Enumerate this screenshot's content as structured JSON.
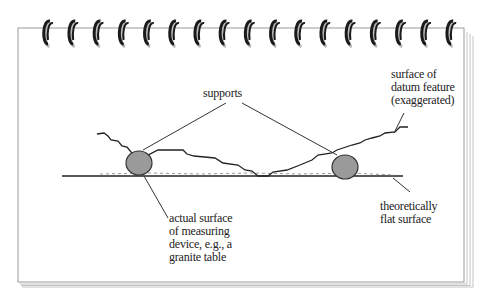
{
  "diagram": {
    "type": "notepad-illustration",
    "ring_count": 17,
    "colors": {
      "page": "#ffffff",
      "page_border": "#9a9a9a",
      "page_stack": "#bdbdbd",
      "ring": "#1a1a1a",
      "support_fill": "#9a9a9a",
      "line": "#2b2b2b"
    },
    "labels": {
      "supports": "supports",
      "datum_surface": "surface of\ndatum feature\n(exaggerated)",
      "measuring_surface": "actual surface\nof measuring\ndevice, e.g., a\ngranite table",
      "flat_surface": "theoretically\nflat surface"
    }
  }
}
